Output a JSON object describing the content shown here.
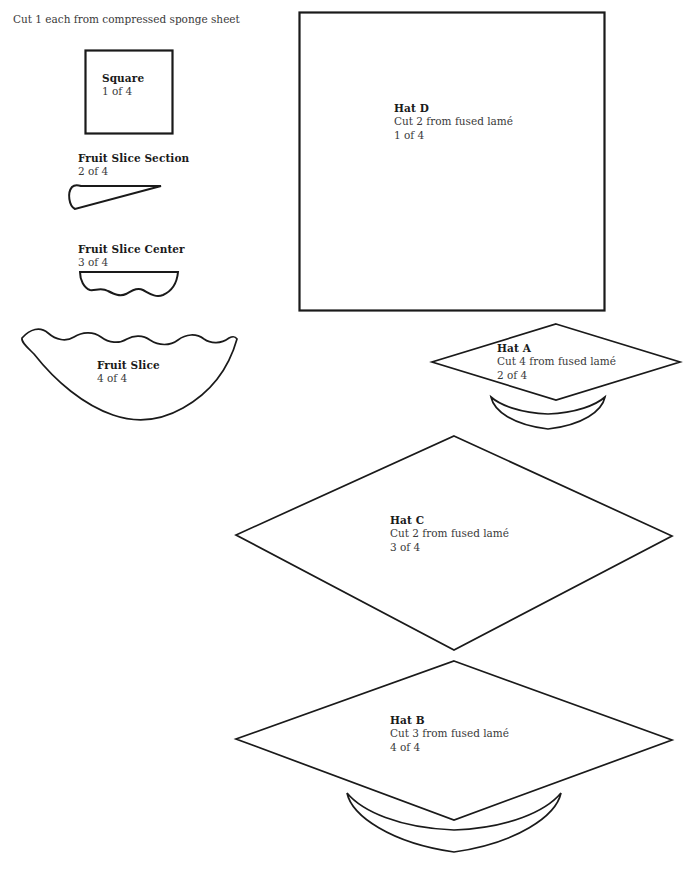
{
  "sheet": {
    "width": 685,
    "height": 876,
    "background_color": "#ffffff",
    "line_color": "#1a1a1a",
    "text_color": "#231f20"
  },
  "header": {
    "note": "Cut 1 each from compressed sponge sheet"
  },
  "pieces": [
    {
      "id": "square",
      "name": "Square",
      "title": "Square",
      "cut_line": "",
      "index_line": "1 of 4",
      "shape": "square",
      "material": "compressed sponge sheet"
    },
    {
      "id": "fruit-slice-section",
      "name": "Fruit Slice Section",
      "title": "Fruit Slice Section",
      "cut_line": "",
      "index_line": "2 of 4",
      "shape": "wedge",
      "material": "compressed sponge sheet"
    },
    {
      "id": "fruit-slice-center",
      "name": "Fruit Slice Center",
      "title": "Fruit Slice Center",
      "cut_line": "",
      "index_line": "3 of 4",
      "shape": "scalloped-half-moon",
      "material": "compressed sponge sheet"
    },
    {
      "id": "fruit-slice",
      "name": "Fruit Slice",
      "title": "Fruit Slice",
      "cut_line": "",
      "index_line": "4 of 4",
      "shape": "scalloped-crescent",
      "material": "compressed sponge sheet"
    },
    {
      "id": "hat-d",
      "name": "Hat D",
      "title": "Hat D",
      "cut_line": "Cut 2 from fused lamé",
      "index_line": "1 of 4",
      "shape": "square",
      "material": "fused lamé"
    },
    {
      "id": "hat-a",
      "name": "Hat A",
      "title": "Hat A",
      "cut_line": "Cut 4 from fused lamé",
      "index_line": "2 of 4",
      "shape": "diamond-with-brim",
      "material": "fused lamé"
    },
    {
      "id": "hat-c",
      "name": "Hat C",
      "title": "Hat C",
      "cut_line": "Cut 2 from fused lamé",
      "index_line": "3 of 4",
      "shape": "diamond",
      "material": "fused lamé"
    },
    {
      "id": "hat-b",
      "name": "Hat B",
      "title": "Hat B",
      "cut_line": "Cut 3 from fused lamé",
      "index_line": "4 of 4",
      "shape": "diamond-with-brim",
      "material": "fused lamé"
    }
  ]
}
